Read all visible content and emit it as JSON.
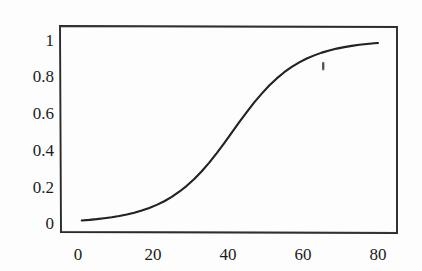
{
  "figure": {
    "background_color": "#fdfdfd",
    "ink_color": "#1b1b1b",
    "artifact_label": "scan-speck"
  },
  "axis": {
    "y_ticks": [
      "1",
      "0.8",
      "0.6",
      "0.4",
      "0.2",
      "0"
    ],
    "x_ticks": [
      "0",
      "20",
      "40",
      "60",
      "80"
    ]
  },
  "chart_data": {
    "type": "line",
    "title": "",
    "subtitle": "",
    "xlabel": "",
    "ylabel": "",
    "xlim": [
      -4,
      86
    ],
    "ylim": [
      -0.04,
      1.09
    ],
    "grid": false,
    "legend": null,
    "xticks": [
      0,
      20,
      40,
      60,
      80
    ],
    "yticks": [
      0,
      0.2,
      0.4,
      0.6,
      0.8,
      1
    ],
    "xtick_labels": [
      "0",
      "20",
      "40",
      "60",
      "80"
    ],
    "ytick_labels": [
      "0",
      "0.2",
      "0.4",
      "0.6",
      "0.8",
      "1"
    ],
    "series": [
      {
        "name": "sigmoid",
        "color": "#1b1b1b",
        "line_width": 2.1,
        "x": [
          1,
          3,
          5,
          7,
          9,
          11,
          13,
          15,
          17,
          19,
          21,
          23,
          25,
          27,
          29,
          31,
          33,
          35,
          37,
          39,
          41,
          43,
          45,
          47,
          49,
          51,
          53,
          55,
          57,
          59,
          61,
          63,
          65,
          67,
          69,
          71,
          73,
          75,
          77,
          79,
          80
        ],
        "y": [
          0.014,
          0.017,
          0.021,
          0.026,
          0.031,
          0.038,
          0.046,
          0.056,
          0.068,
          0.082,
          0.099,
          0.119,
          0.143,
          0.171,
          0.203,
          0.241,
          0.283,
          0.33,
          0.382,
          0.437,
          0.494,
          0.551,
          0.606,
          0.659,
          0.707,
          0.751,
          0.79,
          0.824,
          0.853,
          0.878,
          0.899,
          0.916,
          0.931,
          0.943,
          0.953,
          0.961,
          0.968,
          0.974,
          0.978,
          0.982,
          0.984
        ],
        "model": "logistic",
        "midpoint": 41,
        "steepness": 0.115,
        "min": 0.014,
        "max": 0.984
      }
    ],
    "annotations": [
      {
        "name": "scan-speck",
        "x": 65.5,
        "y": 0.765,
        "text": ""
      }
    ]
  }
}
